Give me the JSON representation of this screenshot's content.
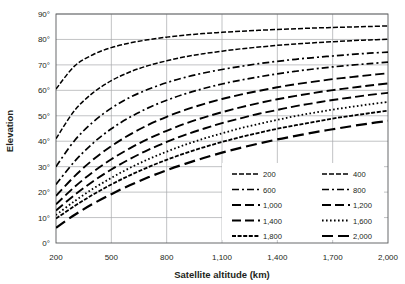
{
  "chart_data": {
    "type": "line",
    "title": "",
    "xlabel": "Satellite altitude (km)",
    "ylabel": "Elevation",
    "xlim": [
      200,
      2000
    ],
    "ylim": [
      0,
      90
    ],
    "xticks": [
      200,
      500,
      800,
      1100,
      1400,
      1700,
      2000
    ],
    "xtick_labels": [
      "200",
      "500",
      "800",
      "1,100",
      "1,400",
      "1,700",
      "2,000"
    ],
    "yticks": [
      0,
      10,
      20,
      30,
      40,
      50,
      60,
      70,
      80,
      90
    ],
    "ytick_labels": [
      "0°",
      "10°",
      "20°",
      "30°",
      "40°",
      "50°",
      "60°",
      "70°",
      "80°",
      "90°"
    ],
    "grid": true,
    "legend_position": "lower-right",
    "x": [
      200,
      300,
      400,
      500,
      600,
      700,
      800,
      900,
      1000,
      1100,
      1200,
      1300,
      1400,
      1500,
      1600,
      1700,
      1800,
      1900,
      2000
    ],
    "series": [
      {
        "name": "200",
        "label": "200",
        "dash": "5,2",
        "width": 1.5,
        "values": [
          60.5,
          69.5,
          74.0,
          76.8,
          78.6,
          79.9,
          80.9,
          81.7,
          82.3,
          82.8,
          83.2,
          83.6,
          83.9,
          84.2,
          84.5,
          84.7,
          84.9,
          85.1,
          85.3
        ]
      },
      {
        "name": "400",
        "label": "400",
        "dash": "5,2",
        "width": 1.5,
        "values": [
          41.0,
          52.0,
          59.0,
          63.8,
          67.2,
          69.7,
          71.6,
          73.2,
          74.4,
          75.4,
          76.3,
          77.0,
          77.7,
          78.2,
          78.7,
          79.1,
          79.5,
          79.8,
          80.1
        ]
      },
      {
        "name": "600",
        "label": "600",
        "dash": "7,3,2,3",
        "width": 1.7,
        "values": [
          30.0,
          40.2,
          47.5,
          53.0,
          57.2,
          60.4,
          63.0,
          65.1,
          66.8,
          68.2,
          69.4,
          70.5,
          71.4,
          72.2,
          72.9,
          73.5,
          74.1,
          74.6,
          75.0
        ]
      },
      {
        "name": "800",
        "label": "800",
        "dash": "7,3,2,3",
        "width": 1.7,
        "values": [
          23.0,
          32.0,
          39.2,
          44.9,
          49.4,
          53.1,
          56.1,
          58.6,
          60.7,
          62.5,
          64.0,
          65.3,
          66.5,
          67.5,
          68.4,
          69.2,
          69.9,
          70.5,
          71.1
        ]
      },
      {
        "name": "1,000",
        "label": "1,000",
        "dash": "9,4",
        "width": 1.9,
        "values": [
          18.5,
          26.2,
          32.7,
          38.1,
          42.6,
          46.4,
          49.6,
          52.3,
          54.6,
          56.6,
          58.3,
          59.8,
          61.2,
          62.4,
          63.4,
          64.4,
          65.2,
          66.0,
          66.7
        ]
      },
      {
        "name": "1,200",
        "label": "1,200",
        "dash": "9,4",
        "width": 1.9,
        "values": [
          15.2,
          22.0,
          27.9,
          32.9,
          37.2,
          40.9,
          44.1,
          46.9,
          49.3,
          51.4,
          53.3,
          55.0,
          56.5,
          57.8,
          59.0,
          60.1,
          61.0,
          61.9,
          62.7
        ]
      },
      {
        "name": "1,400",
        "label": "1,400",
        "dash": "9,4",
        "width": 1.9,
        "values": [
          12.8,
          18.8,
          24.2,
          28.9,
          33.0,
          36.6,
          39.7,
          42.5,
          44.9,
          47.1,
          49.0,
          50.8,
          52.3,
          53.8,
          55.0,
          56.2,
          57.2,
          58.2,
          59.0
        ]
      },
      {
        "name": "1,600",
        "label": "1,600",
        "dash": "1.6,2.4",
        "width": 1.8,
        "values": [
          11.0,
          16.4,
          21.3,
          25.6,
          29.5,
          32.9,
          35.9,
          38.6,
          41.0,
          43.1,
          45.1,
          46.8,
          48.4,
          49.9,
          51.2,
          52.4,
          53.5,
          54.5,
          55.4
        ]
      },
      {
        "name": "1,800",
        "label": "1,800",
        "dash": "4,1.6",
        "width": 1.8,
        "values": [
          9.6,
          14.5,
          19.0,
          23.0,
          26.6,
          29.8,
          32.7,
          35.3,
          37.6,
          39.7,
          41.6,
          43.3,
          44.9,
          46.3,
          47.6,
          48.9,
          50.0,
          51.0,
          52.0
        ]
      },
      {
        "name": "2,000",
        "label": "2,000",
        "dash": "11,5",
        "width": 2.2,
        "values": [
          6.0,
          11.0,
          15.4,
          19.2,
          22.7,
          25.8,
          28.6,
          31.1,
          33.4,
          35.5,
          37.4,
          39.1,
          40.7,
          42.1,
          43.5,
          44.7,
          45.9,
          47.0,
          48.0
        ]
      }
    ],
    "legend_columns": [
      [
        "200",
        "600",
        "1,000",
        "1,400",
        "1,800"
      ],
      [
        "400",
        "800",
        "1,200",
        "1,600",
        "2,000"
      ]
    ]
  }
}
